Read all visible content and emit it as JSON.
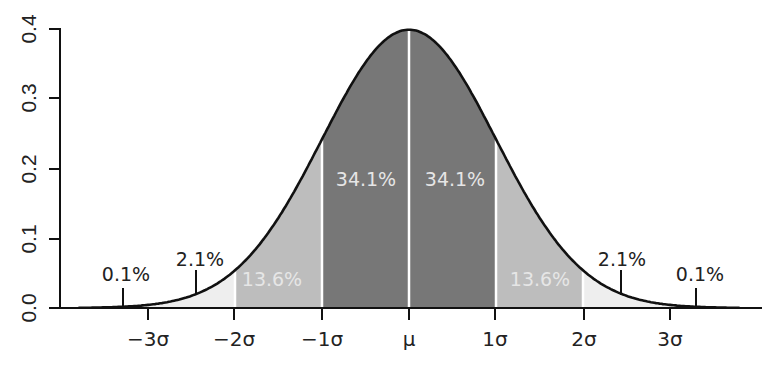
{
  "chart_data": {
    "type": "area",
    "xlabel": "",
    "ylabel": "",
    "ylim": [
      0.0,
      0.4
    ],
    "xlim": [
      -4.0,
      4.0
    ],
    "grid": false,
    "legend": null,
    "y_ticks": [
      "0.0",
      "0.1",
      "0.2",
      "0.3",
      "0.4"
    ],
    "x_ticks": [
      {
        "pos": -3,
        "label": "−3σ"
      },
      {
        "pos": -2,
        "label": "−2σ"
      },
      {
        "pos": -1,
        "label": "−1σ"
      },
      {
        "pos": 0,
        "label": "μ"
      },
      {
        "pos": 1,
        "label": "1σ"
      },
      {
        "pos": 2,
        "label": "2σ"
      },
      {
        "pos": 3,
        "label": "3σ"
      }
    ],
    "curve": {
      "name": "standard normal pdf",
      "mu": 0,
      "sigma": 1,
      "peak": 0.399
    },
    "regions": [
      {
        "from": -4,
        "to": -3,
        "percent": "0.1%",
        "shade": "#ffffff"
      },
      {
        "from": -3,
        "to": -2,
        "percent": "2.1%",
        "shade": "#eeeeee"
      },
      {
        "from": -2,
        "to": -1,
        "percent": "13.6%",
        "shade": "#bdbdbd"
      },
      {
        "from": -1,
        "to": 0,
        "percent": "34.1%",
        "shade": "#777777"
      },
      {
        "from": 0,
        "to": 1,
        "percent": "34.1%",
        "shade": "#777777"
      },
      {
        "from": 1,
        "to": 2,
        "percent": "13.6%",
        "shade": "#bdbdbd"
      },
      {
        "from": 2,
        "to": 3,
        "percent": "2.1%",
        "shade": "#eeeeee"
      },
      {
        "from": 3,
        "to": 4,
        "percent": "0.1%",
        "shade": "#ffffff"
      }
    ],
    "annotations": [
      {
        "text": "0.1%",
        "x": -3.3
      },
      {
        "text": "2.1%",
        "x": -2.45
      },
      {
        "text": "13.6%",
        "x": -1.5
      },
      {
        "text": "34.1%",
        "x": -0.5
      },
      {
        "text": "34.1%",
        "x": 0.5
      },
      {
        "text": "13.6%",
        "x": 1.5
      },
      {
        "text": "2.1%",
        "x": 2.45
      },
      {
        "text": "0.1%",
        "x": 3.3
      }
    ]
  },
  "labels": {
    "y": [
      "0.0",
      "0.1",
      "0.2",
      "0.3",
      "0.4"
    ],
    "x": [
      "−3σ",
      "−2σ",
      "−1σ",
      "μ",
      "1σ",
      "2σ",
      "3σ"
    ],
    "pct": {
      "tail_left": "0.1%",
      "band3_left": "2.1%",
      "band2_left": "13.6%",
      "band1_left": "34.1%",
      "band1_right": "34.1%",
      "band2_right": "13.6%",
      "band3_right": "2.1%",
      "tail_right": "0.1%"
    }
  },
  "colors": {
    "band1": "#777777",
    "band2": "#bdbdbd",
    "band3": "#eeeeee",
    "curve": "#111111",
    "axis": "#111111"
  }
}
